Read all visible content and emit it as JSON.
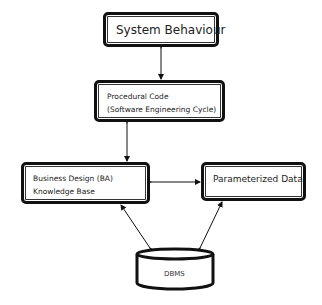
{
  "diagram": {
    "nodes": {
      "system_behaviour": {
        "label": "System Behaviour"
      },
      "procedural_code": {
        "line1": "Procedural Code",
        "line2": "(Software Engineering Cycle)"
      },
      "business_design": {
        "line1": "Business Design (BA)",
        "line2": "Knowledge Base"
      },
      "parameterized_data": {
        "label": "Parameterized Data"
      },
      "dbms": {
        "label": "DBMS"
      }
    },
    "edges": [
      {
        "from": "System Behaviour",
        "to": "Procedural Code",
        "type": "bidirectional"
      },
      {
        "from": "Procedural Code",
        "to": "Business Design (BA) Knowledge Base",
        "type": "bidirectional"
      },
      {
        "from": "Business Design (BA) Knowledge Base",
        "to": "Parameterized Data",
        "type": "bidirectional"
      },
      {
        "from": "DBMS",
        "to": "Business Design (BA) Knowledge Base",
        "type": "bidirectional"
      },
      {
        "from": "DBMS",
        "to": "Parameterized Data",
        "type": "bidirectional"
      }
    ],
    "colors": {
      "stroke": "#111111",
      "background": "#ffffff",
      "text": "#222222"
    }
  }
}
